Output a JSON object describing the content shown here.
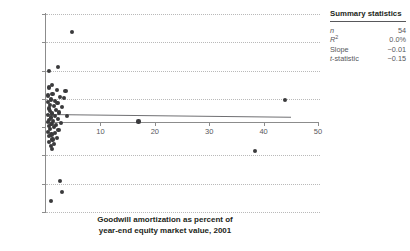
{
  "chart_data": {
    "type": "scatter",
    "title": "",
    "xlabel": "Goodwill amortization as percent of year-end equity market value, 2001",
    "ylabel": "",
    "xlim": [
      0,
      50
    ],
    "ylim": [
      -15,
      20
    ],
    "xticks": [
      10,
      20,
      30,
      40,
      50
    ],
    "yticks": [
      20,
      15,
      10,
      5,
      0,
      -5,
      -10,
      -15
    ],
    "grid": "horizontal-dotted",
    "legend": "none",
    "points": [
      [
        4.8,
        16.8
      ],
      [
        2.2,
        10.6
      ],
      [
        0.6,
        9.9
      ],
      [
        1.1,
        7.4
      ],
      [
        0.5,
        7.0
      ],
      [
        2.0,
        6.6
      ],
      [
        3.6,
        6.4
      ],
      [
        1.2,
        5.9
      ],
      [
        0.4,
        5.6
      ],
      [
        2.6,
        5.3
      ],
      [
        3.3,
        5.1
      ],
      [
        0.9,
        4.9
      ],
      [
        1.7,
        4.6
      ],
      [
        0.3,
        4.4
      ],
      [
        2.1,
        4.2
      ],
      [
        0.7,
        3.9
      ],
      [
        1.4,
        3.7
      ],
      [
        3.0,
        3.5
      ],
      [
        0.5,
        3.3
      ],
      [
        1.9,
        3.0
      ],
      [
        0.8,
        2.8
      ],
      [
        2.4,
        2.6
      ],
      [
        1.1,
        2.4
      ],
      [
        0.4,
        2.2
      ],
      [
        1.6,
        2.0
      ],
      [
        3.8,
        1.9
      ],
      [
        0.9,
        1.7
      ],
      [
        2.2,
        1.5
      ],
      [
        0.6,
        1.3
      ],
      [
        1.3,
        1.1
      ],
      [
        0.3,
        0.9
      ],
      [
        2.8,
        0.8
      ],
      [
        1.0,
        0.6
      ],
      [
        1.8,
        0.4
      ],
      [
        0.5,
        0.2
      ],
      [
        1.4,
        0.0
      ],
      [
        0.8,
        -0.3
      ],
      [
        2.3,
        -0.5
      ],
      [
        0.4,
        -0.8
      ],
      [
        1.6,
        -1.0
      ],
      [
        1.0,
        -1.3
      ],
      [
        0.6,
        -1.6
      ],
      [
        2.0,
        -1.9
      ],
      [
        1.2,
        -2.2
      ],
      [
        0.5,
        -2.6
      ],
      [
        1.5,
        -3.0
      ],
      [
        0.9,
        -3.4
      ],
      [
        1.1,
        -3.9
      ],
      [
        17.0,
        1.0
      ],
      [
        44.0,
        4.8
      ],
      [
        38.4,
        -4.2
      ],
      [
        2.6,
        -9.5
      ],
      [
        3.0,
        -11.5
      ],
      [
        0.9,
        -13.0
      ]
    ],
    "fit_line": {
      "x0": 0,
      "y0": 2.4,
      "x1": 45,
      "y1": 1.9,
      "style": "solid"
    }
  },
  "caption": {
    "line1": "Goodwill amortization as percent of",
    "line2": "year-end equity market value, 2001"
  },
  "summary": {
    "title": "Summary statistics",
    "rows": [
      {
        "label": "n",
        "label_style": "italic",
        "value": "54"
      },
      {
        "label": "R",
        "label_sup": "2",
        "label_style": "italic",
        "value": "0.0%"
      },
      {
        "label": "Slope",
        "label_style": "normal",
        "value": "−0.01"
      },
      {
        "label": "t-statistic",
        "label_style": "italic-first",
        "value": "−0.15"
      }
    ]
  },
  "colors": {
    "dot": "#3a3a3c",
    "axis": "#8c8c8c",
    "grid": "#b9b9b9",
    "fit": "#6f6f72",
    "text": "#231f20",
    "muted": "#58585b"
  }
}
